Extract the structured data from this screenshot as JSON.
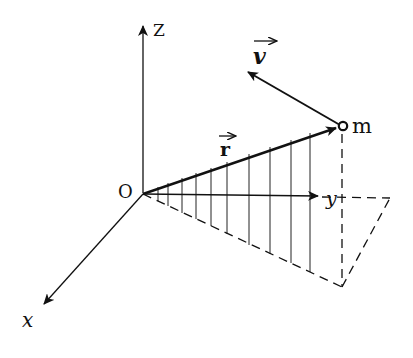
{
  "diagram": {
    "labels": {
      "origin": "O",
      "z_axis": "Z",
      "y_axis": "y",
      "x_axis": "x",
      "mass": "m",
      "position_vector": "r",
      "velocity_vector": "v"
    },
    "colors": {
      "ink": "#111111",
      "background": "#ffffff"
    }
  }
}
